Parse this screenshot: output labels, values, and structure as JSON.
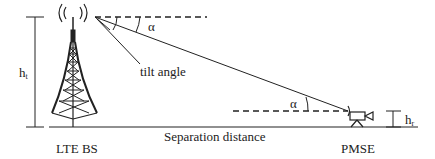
{
  "diagram": {
    "labels": {
      "tilt_angle": "tilt angle",
      "alpha_top": "α",
      "alpha_bottom": "α",
      "ht_main": "h",
      "ht_sub": "t",
      "hr_main": "h",
      "hr_sub": "r",
      "separation": "Separation distance",
      "lte_bs": "LTE BS",
      "pmse": "PMSE"
    },
    "colors": {
      "stroke": "#222222",
      "background": "#ffffff"
    }
  }
}
